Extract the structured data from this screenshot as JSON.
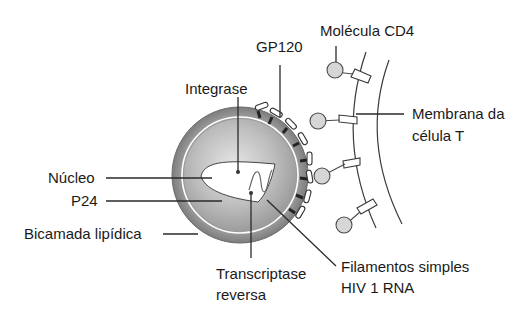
{
  "diagram": {
    "type": "labeled-illustration",
    "colors": {
      "outer_ring": "#8f8f8f",
      "inner_body": "#b5b5b5",
      "receptor_fill": "#d9d9d9",
      "line": "#2a2a2a",
      "background": "#ffffff"
    },
    "labels": {
      "integrase": "Integrase",
      "gp120": "GP120",
      "cd4": "Molécula CD4",
      "membrane_line1": "Membrana da",
      "membrane_line2": "célula T",
      "nucleo": "Núcleo",
      "p24": "P24",
      "bilayer": "Bicamada lipídica",
      "rt_line1": "Transcriptase",
      "rt_line2": "reversa",
      "rna_line1": "Filamentos simples",
      "rna_line2": "HIV 1 RNA"
    }
  }
}
